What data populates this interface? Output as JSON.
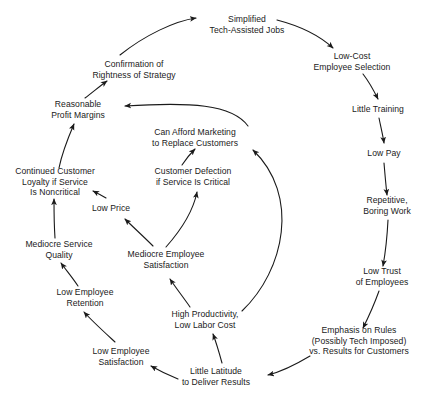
{
  "diagram": {
    "type": "causal-loop-diagram",
    "background_color": "#ffffff",
    "text_color": "#1a1a1a",
    "arrow_color": "#1a1a1a",
    "nodes": [
      {
        "id": "simplified-jobs",
        "lines": [
          "Simplified",
          "Tech-Assisted Jobs"
        ],
        "x": 247,
        "y": 25
      },
      {
        "id": "low-cost-selection",
        "lines": [
          "Low-Cost",
          "Employee Selection"
        ],
        "x": 352,
        "y": 62
      },
      {
        "id": "little-training",
        "lines": [
          "Little Training"
        ],
        "x": 378,
        "y": 109
      },
      {
        "id": "low-pay",
        "lines": [
          "Low Pay"
        ],
        "x": 384,
        "y": 153
      },
      {
        "id": "repetitive-boring-work",
        "lines": [
          "Repetitive,",
          "Boring Work"
        ],
        "x": 387,
        "y": 206
      },
      {
        "id": "low-trust-employees",
        "lines": [
          "Low Trust",
          "of Employees"
        ],
        "x": 382,
        "y": 277
      },
      {
        "id": "emphasis-on-rules",
        "lines": [
          "Emphasis on Rules",
          "(Possibly Tech Imposed)",
          "vs. Results for Customers"
        ],
        "x": 359,
        "y": 341
      },
      {
        "id": "little-latitude",
        "lines": [
          "Little Latitude",
          "to Deliver Results"
        ],
        "x": 216,
        "y": 377
      },
      {
        "id": "low-employee-satisfaction",
        "lines": [
          "Low Employee",
          "Satisfaction"
        ],
        "x": 121,
        "y": 357
      },
      {
        "id": "low-employee-retention",
        "lines": [
          "Low Employee",
          "Retention"
        ],
        "x": 85,
        "y": 298
      },
      {
        "id": "mediocre-service-quality",
        "lines": [
          "Mediocre Service",
          "Quality"
        ],
        "x": 59,
        "y": 250
      },
      {
        "id": "continued-customer-loyalty",
        "lines": [
          "Continued Customer",
          "Loyalty if Service",
          "Is Noncritical"
        ],
        "x": 55,
        "y": 182
      },
      {
        "id": "reasonable-profit-margins",
        "lines": [
          "Reasonable",
          "Profit Margins"
        ],
        "x": 78,
        "y": 110
      },
      {
        "id": "confirmation-of-rightness",
        "lines": [
          "Confirmation of",
          "Rightness of Strategy"
        ],
        "x": 134,
        "y": 70
      },
      {
        "id": "low-price",
        "lines": [
          "Low Price"
        ],
        "x": 111,
        "y": 208
      },
      {
        "id": "mediocre-employee-satisfaction",
        "lines": [
          "Mediocre Employee",
          "Satisfaction"
        ],
        "x": 166,
        "y": 260
      },
      {
        "id": "high-productivity",
        "lines": [
          "High Productivity,",
          "Low Labor Cost"
        ],
        "x": 205,
        "y": 320
      },
      {
        "id": "customer-defection",
        "lines": [
          "Customer Defection",
          "if Service Is Critical"
        ],
        "x": 193,
        "y": 177
      },
      {
        "id": "can-afford-marketing",
        "lines": [
          "Can Afford Marketing",
          "to Replace Customers"
        ],
        "x": 195,
        "y": 138
      }
    ],
    "edges": [
      {
        "id": "confirmation-to-simplified",
        "from": "confirmation-of-rightness",
        "to": "simplified-jobs",
        "path": "M 120 55 C 145 35 175 21 196 18"
      },
      {
        "id": "simplified-to-lowcost",
        "from": "simplified-jobs",
        "to": "low-cost-selection",
        "path": "M 277 20 C 300 26 320 36 333 48"
      },
      {
        "id": "lowcost-to-training",
        "from": "low-cost-selection",
        "to": "little-training",
        "path": "M 363 74 C 370 83 374 91 378 99"
      },
      {
        "id": "training-to-lowpay",
        "from": "little-training",
        "to": "low-pay",
        "path": "M 379 118 C 381 128 383 136 384 143"
      },
      {
        "id": "lowpay-to-repetitive",
        "from": "low-pay",
        "to": "repetitive-boring-work",
        "path": "M 384 163 C 385 175 386 186 387 195"
      },
      {
        "id": "repetitive-to-lowtrust",
        "from": "repetitive-boring-work",
        "to": "low-trust-employees",
        "path": "M 388 220 C 387 240 385 255 383 266"
      },
      {
        "id": "lowtrust-to-rules",
        "from": "low-trust-employees",
        "to": "emphasis-on-rules",
        "path": "M 379 291 C 374 305 368 318 363 328"
      },
      {
        "id": "rules-to-latitude",
        "from": "emphasis-on-rules",
        "to": "little-latitude",
        "path": "M 310 356 C 295 365 280 372 268 375"
      },
      {
        "id": "latitude-to-lowempsat",
        "from": "little-latitude",
        "to": "low-employee-satisfaction",
        "path": "M 178 379 C 168 375 158 370 151 366"
      },
      {
        "id": "lowempsat-to-retention",
        "from": "low-employee-satisfaction",
        "to": "low-employee-retention",
        "path": "M 115 342 C 102 330 91 320 84 312"
      },
      {
        "id": "retention-to-servicequality",
        "from": "low-employee-retention",
        "to": "mediocre-service-quality",
        "path": "M 78 286 C 72 277 66 270 61 263"
      },
      {
        "id": "servicequality-to-loyalty",
        "from": "mediocre-service-quality",
        "to": "continued-customer-loyalty",
        "path": "M 55 238 C 54 224 54 211 54 199"
      },
      {
        "id": "loyalty-to-margins",
        "from": "continued-customer-loyalty",
        "to": "reasonable-profit-margins",
        "path": "M 59 168 C 62 153 68 138 74 124"
      },
      {
        "id": "margins-to-confirmation",
        "from": "reasonable-profit-margins",
        "to": "confirmation-of-rightness",
        "path": "M 85 98 C 93 92 100 86 107 81"
      },
      {
        "id": "latitude-to-productivity",
        "from": "little-latitude",
        "to": "high-productivity",
        "path": "M 222 363 C 219 352 216 342 213 334"
      },
      {
        "id": "productivity-to-mediocreempsat",
        "from": "high-productivity",
        "to": "mediocre-employee-satisfaction",
        "path": "M 190 307 C 183 297 176 288 170 279"
      },
      {
        "id": "mediocreempsat-to-lowprice",
        "from": "mediocre-employee-satisfaction",
        "to": "low-price",
        "path": "M 153 246 C 143 236 133 227 125 219"
      },
      {
        "id": "lowprice-to-loyalty",
        "from": "low-price",
        "to": "continued-customer-loyalty",
        "path": "M 106 198 C 101 195 97 193 93 191"
      },
      {
        "id": "mediocreempsat-to-defection",
        "from": "mediocre-employee-satisfaction",
        "to": "customer-defection",
        "path": "M 166 247 C 182 229 193 212 197 192"
      },
      {
        "id": "defection-to-marketing",
        "from": "customer-defection",
        "to": "can-afford-marketing",
        "path": "M 182 165 C 186 159 190 154 195 149"
      },
      {
        "id": "productivity-to-marketing",
        "from": "high-productivity",
        "to": "can-afford-marketing",
        "path": "M 242 311 C 285 270 300 195 253 150"
      },
      {
        "id": "marketing-to-margins",
        "from": "can-afford-marketing",
        "to": "reasonable-profit-margins",
        "path": "M 248 126 C 232 104 190 102 125 106"
      }
    ]
  }
}
